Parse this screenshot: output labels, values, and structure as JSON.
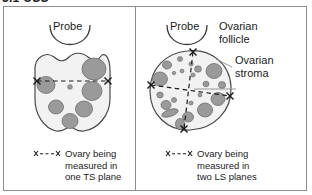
{
  "heading": "3.1 USS",
  "colors": {
    "frame_border": "#8e8e8e",
    "text": "#1b1b1b",
    "ovary_outline": "#4a4a4a",
    "ovary_fill": "#f2f2f2",
    "follicle_fill": "#9a9a9a",
    "follicle_outline": "#6e6e6e",
    "probe_stroke": "#3d3d3d",
    "measure_line": "#1b1b1b",
    "leader_line": "#8e8e8e"
  },
  "panels": [
    {
      "id": "transverse-section",
      "probe_label": "Probe",
      "caption": {
        "key_symbol": "x- - -x",
        "lines": [
          "Ovary being",
          "measured in",
          "one TS plane"
        ]
      },
      "measurement_axes": 1,
      "follicle_count": 7
    },
    {
      "id": "longitudinal-section",
      "probe_label": "Probe",
      "caption": {
        "key_symbol": "x- - -x",
        "lines": [
          "Ovary being",
          "measured in",
          "two LS planes"
        ]
      },
      "callouts": [
        {
          "id": "ovarian-follicle",
          "lines": [
            "Ovarian",
            "follicle"
          ]
        },
        {
          "id": "ovarian-stroma",
          "lines": [
            "Ovarian",
            "stroma"
          ]
        }
      ],
      "measurement_axes": 2,
      "follicle_count": 21
    }
  ]
}
